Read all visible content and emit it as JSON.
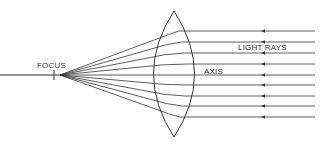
{
  "diagram": {
    "labels": {
      "focus": "FOCUS",
      "light_rays": "LIGHT RAYS",
      "axis": "AXIS"
    },
    "colors": {
      "line": "#333333",
      "background": "#ffffff"
    },
    "focus_point": [
      60,
      75
    ],
    "ray_y": [
      31,
      42,
      53,
      64,
      75,
      85,
      96,
      106,
      117
    ],
    "ray_right_x": 315,
    "arrow_x": 261
  }
}
